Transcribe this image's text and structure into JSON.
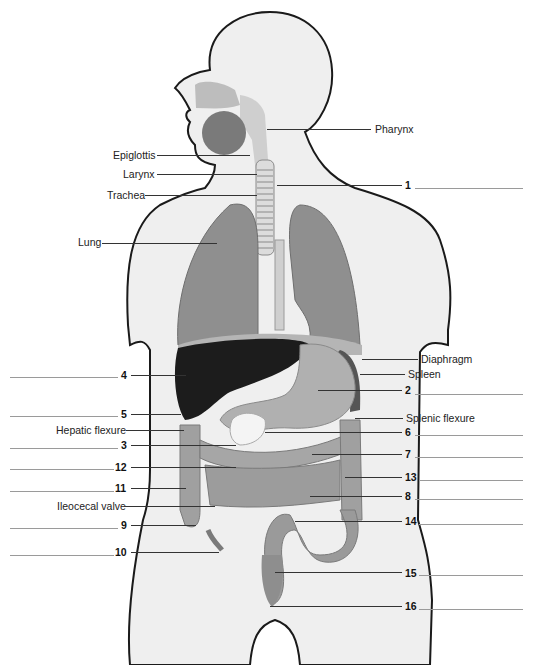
{
  "figure": {
    "colors": {
      "background": "#ffffff",
      "body_fill": "#efefef",
      "body_outline": "#1a1a1a",
      "organ_gray": "#9c9c9c",
      "lung_gray": "#8f8f8f",
      "liver_dark": "#1c1c1c",
      "leader_line": "#333333",
      "blank_line": "#9a9a9a"
    }
  },
  "labels": {
    "pharynx": "Pharynx",
    "epiglottis": "Epiglottis",
    "larynx": "Larynx",
    "trachea": "Trachea",
    "lung": "Lung",
    "diaphragm": "Diaphragm",
    "spleen": "Spleen",
    "splenic_flexure": "Splenic flexure",
    "hepatic_flexure": "Hepatic flexure",
    "ileocecal_valve": "Ileocecal valve"
  },
  "numbers": {
    "n1": "1",
    "n2": "2",
    "n3": "3",
    "n4": "4",
    "n5": "5",
    "n6": "6",
    "n7": "7",
    "n8": "8",
    "n9": "9",
    "n10": "10",
    "n11": "11",
    "n12": "12",
    "n13": "13",
    "n14": "14",
    "n15": "15",
    "n16": "16"
  }
}
